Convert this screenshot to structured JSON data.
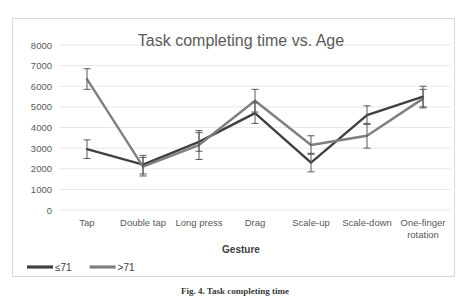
{
  "chart_data": {
    "type": "line",
    "title": "Task completing time vs. Age",
    "xlabel": "Gesture",
    "ylabel": "",
    "categories": [
      "Tap",
      "Double tap",
      "Long press",
      "Drag",
      "Scale-up",
      "Scale-down",
      "One-finger rotation"
    ],
    "ylim": [
      0,
      8000
    ],
    "yticks": [
      0,
      1000,
      2000,
      3000,
      4000,
      5000,
      6000,
      7000,
      8000
    ],
    "ytick_labels": [
      "0",
      "1000",
      "2000",
      "3000",
      "4000",
      "5000",
      "6000",
      "7000",
      "8000"
    ],
    "grid": true,
    "legend_position": "bottom-left",
    "series": [
      {
        "name": "≤71",
        "color": "#404040",
        "values": [
          2950,
          2200,
          3300,
          4700,
          2300,
          4600,
          5500
        ],
        "errors": [
          450,
          450,
          450,
          500,
          450,
          450,
          500
        ]
      },
      {
        "name": ">71",
        "color": "#7f7f7f",
        "values": [
          6350,
          2100,
          3150,
          5300,
          3150,
          3600,
          5400
        ],
        "errors": [
          500,
          450,
          700,
          550,
          450,
          600,
          450
        ]
      }
    ]
  },
  "caption": {
    "text": "Fig. 4.  Task completing time"
  },
  "colors": {
    "gridline": "#e8e8e8",
    "border": "#d9d9d9",
    "tick_text": "#595959",
    "title_text": "#5a5a5a"
  }
}
